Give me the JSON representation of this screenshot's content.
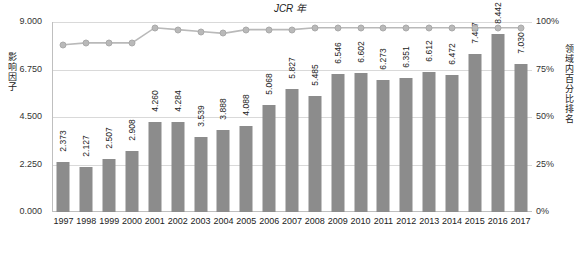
{
  "chart_data": {
    "type": "bar",
    "title": "",
    "subtitle": "",
    "xlabel": "JCR 年",
    "ylabel": "影响因子",
    "y2label": "领域内百分比排名",
    "categories": [
      "1997",
      "1998",
      "1999",
      "2000",
      "2001",
      "2002",
      "2003",
      "2004",
      "2005",
      "2006",
      "2007",
      "2008",
      "2009",
      "2010",
      "2011",
      "2012",
      "2013",
      "2014",
      "2015",
      "2016",
      "2017"
    ],
    "ylim": [
      0,
      9.0
    ],
    "yticks": [
      "0.000",
      "2.250",
      "4.500",
      "6.750",
      "9.000"
    ],
    "y2lim": [
      0,
      100
    ],
    "y2ticks": [
      "0%",
      "25%",
      "50%",
      "75%",
      "100%"
    ],
    "grid": true,
    "legend": "none",
    "series": [
      {
        "name": "影响因子",
        "type": "bar",
        "color": "#8c8c8c",
        "values": [
          2.373,
          2.127,
          2.507,
          2.908,
          4.26,
          4.284,
          3.539,
          3.888,
          4.088,
          5.068,
          5.827,
          5.485,
          6.546,
          6.602,
          6.273,
          6.351,
          6.612,
          6.472,
          7.487,
          8.442,
          7.03
        ],
        "labels": [
          "2.373",
          "2.127",
          "2.507",
          "2.908",
          "4.260",
          "4.284",
          "3.539",
          "3.888",
          "4.088",
          "5.068",
          "5.827",
          "5.485",
          "6.546",
          "6.602",
          "6.273",
          "6.351",
          "6.612",
          "6.472",
          "7.487",
          "8.442",
          "7.030"
        ]
      },
      {
        "name": "领域内百分比排名",
        "type": "line",
        "color": "#b9b9b9",
        "values": [
          88,
          89,
          89,
          89,
          97,
          96,
          95,
          94,
          96,
          96,
          96,
          97,
          97,
          97,
          97,
          97,
          97,
          97,
          97,
          97,
          97
        ]
      }
    ]
  }
}
